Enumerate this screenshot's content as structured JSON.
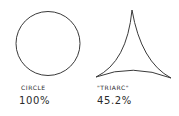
{
  "figures": [
    {
      "shape": "circle",
      "label": "CIRCLE",
      "value": "100%"
    },
    {
      "shape": "triarc",
      "label": "\"TRIARC\"",
      "value": "45.2%"
    }
  ],
  "colors": {
    "stroke": "#3a3a3a",
    "text": "#2a2a2a",
    "background": "#ffffff"
  }
}
